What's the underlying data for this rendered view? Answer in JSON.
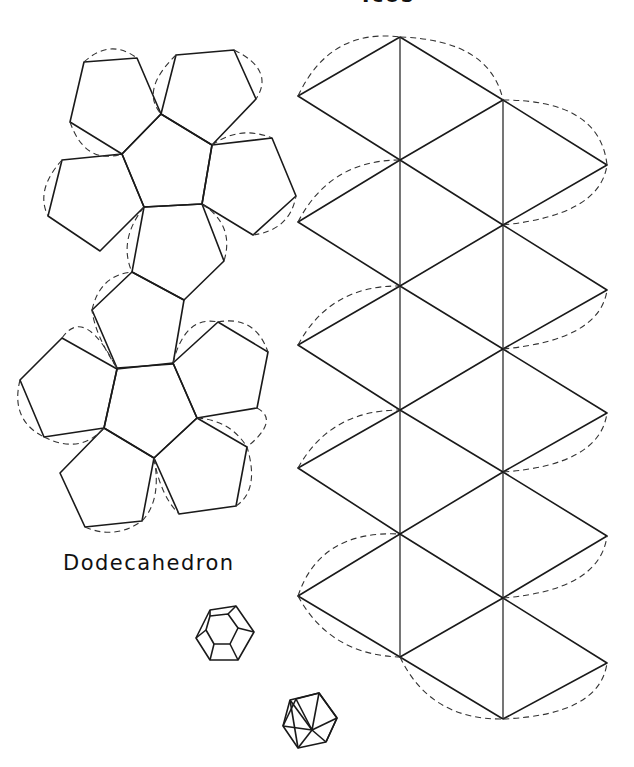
{
  "labels": {
    "top_cut": "Icos",
    "dodecahedron": "Dodecahedron"
  },
  "colors": {
    "line": "#1a1a1a",
    "background": "#ffffff"
  },
  "dodecahedron_net": {
    "pentagons": [
      [
        [
          161,
          114
        ],
        [
          212,
          145
        ],
        [
          202,
          204
        ],
        [
          144,
          207
        ],
        [
          122,
          154
        ]
      ],
      [
        [
          84,
          62
        ],
        [
          137,
          58
        ],
        [
          161,
          114
        ],
        [
          122,
          154
        ],
        [
          70,
          122
        ]
      ],
      [
        [
          176,
          55
        ],
        [
          234,
          50
        ],
        [
          256,
          99
        ],
        [
          212,
          145
        ],
        [
          161,
          114
        ]
      ],
      [
        [
          212,
          145
        ],
        [
          272,
          138
        ],
        [
          296,
          196
        ],
        [
          253,
          235
        ],
        [
          202,
          204
        ]
      ],
      [
        [
          122,
          154
        ],
        [
          62,
          160
        ],
        [
          48,
          216
        ],
        [
          100,
          251
        ],
        [
          144,
          207
        ]
      ],
      [
        [
          144,
          207
        ],
        [
          202,
          204
        ],
        [
          224,
          261
        ],
        [
          184,
          300
        ],
        [
          132,
          272
        ]
      ],
      [
        [
          132,
          272
        ],
        [
          184,
          300
        ],
        [
          173,
          364
        ],
        [
          117,
          368
        ],
        [
          92,
          310
        ]
      ],
      [
        [
          117,
          369
        ],
        [
          173,
          363
        ],
        [
          197,
          418
        ],
        [
          154,
          458
        ],
        [
          104,
          428
        ]
      ],
      [
        [
          117,
          369
        ],
        [
          62,
          338
        ],
        [
          20,
          380
        ],
        [
          44,
          437
        ],
        [
          104,
          428
        ]
      ],
      [
        [
          173,
          363
        ],
        [
          218,
          322
        ],
        [
          268,
          352
        ],
        [
          257,
          408
        ],
        [
          197,
          418
        ]
      ],
      [
        [
          104,
          428
        ],
        [
          154,
          458
        ],
        [
          142,
          521
        ],
        [
          85,
          527
        ],
        [
          60,
          473
        ]
      ],
      [
        [
          154,
          458
        ],
        [
          197,
          418
        ],
        [
          247,
          447
        ],
        [
          236,
          506
        ],
        [
          179,
          514
        ]
      ]
    ]
  },
  "icosahedron_net": {
    "columns": {
      "left": {
        "x": 298,
        "y": [
          96,
          222,
          345,
          468,
          596
        ]
      },
      "center": {
        "x": 400,
        "y": [
          37,
          160,
          286,
          410,
          534,
          657
        ]
      },
      "right": {
        "x": 503,
        "y": [
          100,
          225,
          349,
          472,
          598,
          719
        ]
      },
      "far_right": {
        "x": 607,
        "y": [
          165,
          290,
          413,
          536,
          663
        ]
      }
    }
  }
}
